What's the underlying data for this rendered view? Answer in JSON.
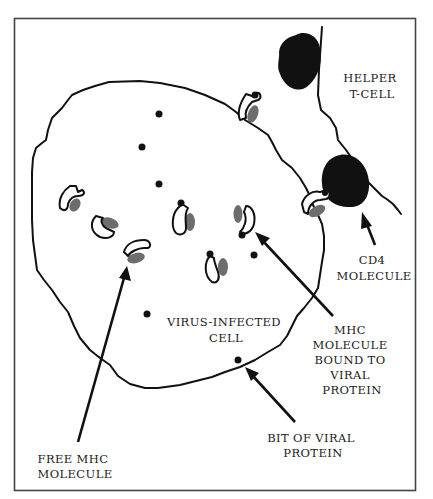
{
  "diagram": {
    "type": "biology-illustration",
    "colors": {
      "line": "#111111",
      "viral_protein_bit": "#111111",
      "mhc_gray_domain": "#6d6d6d",
      "cd4": "#000000",
      "frame": "#444444",
      "background": "#ffffff"
    },
    "labels": {
      "helper_t_cell": [
        "HELPER",
        "T-CELL"
      ],
      "cd4_molecule": [
        "CD4",
        "MOLECULE"
      ],
      "virus_infected_cell": [
        "VIRUS-INFECTED",
        "CELL"
      ],
      "mhc_bound": [
        "MHC",
        "MOLECULE",
        "BOUND TO",
        "VIRAL",
        "PROTEIN"
      ],
      "bit_viral_protein": [
        "BIT OF VIRAL",
        "PROTEIN"
      ],
      "free_mhc": [
        "FREE MHC",
        "MOLECULE"
      ]
    },
    "entities": [
      {
        "name": "Virus-infected cell",
        "kind": "cell-outline"
      },
      {
        "name": "Helper T-cell",
        "kind": "cell-outline"
      },
      {
        "name": "CD4 molecule",
        "kind": "black-blob",
        "count": 2
      },
      {
        "name": "Free MHC molecule",
        "kind": "mhc-shape",
        "count": 3
      },
      {
        "name": "MHC molecule bound to viral protein",
        "kind": "mhc-shape-with-dot",
        "count": 5
      },
      {
        "name": "Bit of viral protein",
        "kind": "dot",
        "count": 6
      }
    ],
    "arrows": [
      {
        "from": "FREE MHC MOLECULE",
        "to": "free MHC molecule"
      },
      {
        "from": "BIT OF VIRAL PROTEIN",
        "to": "viral protein dot"
      },
      {
        "from": "MHC MOLECULE BOUND TO VIRAL PROTEIN",
        "to": "bound MHC molecule"
      },
      {
        "from": "CD4 MOLECULE",
        "to": "CD4 blob"
      }
    ]
  }
}
